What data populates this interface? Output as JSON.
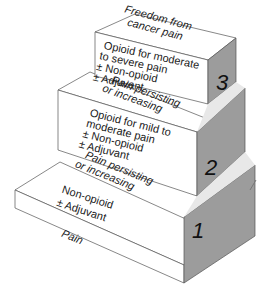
{
  "diagram": {
    "type": "staircase",
    "steps": [
      {
        "number": "1",
        "entry_label": "Pain",
        "treatment": [
          "Non-opioid",
          "± Adjuvant"
        ]
      },
      {
        "number": "2",
        "entry_label": [
          "Pain persisting",
          "or increasing"
        ],
        "treatment": [
          "Opioid for mild to",
          "moderate pain",
          "± Non-opioid",
          "± Adjuvant"
        ]
      },
      {
        "number": "3",
        "entry_label": [
          "Pain persisting",
          "or increasing"
        ],
        "treatment": [
          "Opioid for moderate",
          "to severe pain",
          "± Non-opioid",
          "± Adjuvant"
        ]
      }
    ],
    "outcome_label": [
      "Freedom from",
      "cancer pain"
    ],
    "colors": {
      "top_face": "#ffffff",
      "front_face": "#ffffff",
      "side_face": "#9a9a9a",
      "outline": "#555555"
    }
  }
}
